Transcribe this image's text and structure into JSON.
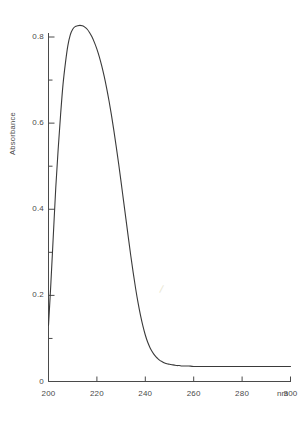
{
  "chart_data": {
    "type": "line",
    "title": "",
    "subtitle": "",
    "xlabel": "nm",
    "ylabel": "Absorbance",
    "xlim": [
      200,
      300
    ],
    "ylim": [
      0,
      0.85
    ],
    "grid": false,
    "legend": null,
    "x_ticks": [
      200,
      220,
      240,
      260,
      280,
      300
    ],
    "x_tick_labels": [
      "200",
      "220",
      "240",
      "260",
      "280",
      "300"
    ],
    "x_minor_ticks": [
      210,
      230,
      250,
      270,
      290
    ],
    "y_ticks": [
      0,
      0.2,
      0.4,
      0.6,
      0.8
    ],
    "y_tick_labels": [
      "0",
      "0.2",
      "0.4",
      "0.6",
      "0.8"
    ],
    "y_minor_ticks": [
      0.1,
      0.3,
      0.5,
      0.7
    ],
    "series": [
      {
        "name": "absorbance-spectrum",
        "color": "#3a3a3a",
        "line_width": 1.1,
        "x": [
          200,
          201,
          202,
          203,
          204,
          205,
          206,
          207,
          208,
          209,
          210,
          211,
          212,
          213,
          214,
          215,
          216,
          217,
          218,
          219,
          220,
          221,
          222,
          223,
          224,
          225,
          226,
          227,
          228,
          229,
          230,
          231,
          232,
          233,
          234,
          235,
          236,
          237,
          238,
          239,
          240,
          241,
          242,
          243,
          244,
          245,
          246,
          247,
          248,
          249,
          250,
          251,
          252,
          253,
          254,
          255,
          256,
          258,
          260,
          265,
          270,
          275,
          280,
          285,
          290,
          295,
          300
        ],
        "y": [
          0.13,
          0.23,
          0.34,
          0.45,
          0.54,
          0.62,
          0.69,
          0.74,
          0.78,
          0.805,
          0.818,
          0.824,
          0.826,
          0.827,
          0.826,
          0.823,
          0.818,
          0.81,
          0.8,
          0.787,
          0.772,
          0.754,
          0.733,
          0.709,
          0.682,
          0.652,
          0.619,
          0.583,
          0.545,
          0.505,
          0.463,
          0.42,
          0.377,
          0.334,
          0.292,
          0.253,
          0.216,
          0.183,
          0.154,
          0.129,
          0.108,
          0.091,
          0.078,
          0.068,
          0.06,
          0.054,
          0.049,
          0.046,
          0.043,
          0.041,
          0.04,
          0.039,
          0.038,
          0.037,
          0.037,
          0.036,
          0.036,
          0.036,
          0.035,
          0.035,
          0.035,
          0.035,
          0.035,
          0.035,
          0.035,
          0.035,
          0.035
        ]
      }
    ],
    "annotations": [
      {
        "name": "peak",
        "x": 213,
        "y": 0.827,
        "label": ""
      }
    ],
    "axis_color": "#4a4a4a",
    "background_color": "#ffffff"
  },
  "axes": {
    "y_title": "Absorbance",
    "x_unit": "nm",
    "y_labels": [
      "0.8",
      "0.6",
      "0.4",
      "0.2",
      "0"
    ],
    "x_labels": [
      "200",
      "220",
      "240",
      "260",
      "280",
      "300"
    ]
  },
  "marks": {
    "stray_slash": "/"
  }
}
